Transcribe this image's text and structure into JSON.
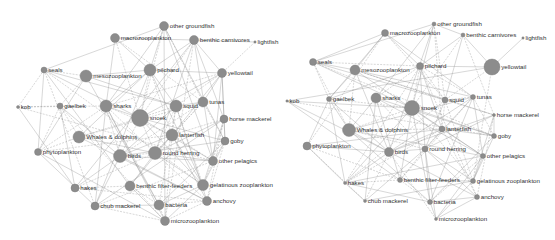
{
  "figure": {
    "panels": [
      {
        "id": "left",
        "node_color": "#8c8c8c",
        "edge_color": "#8a8a8a",
        "nodes": [
          {
            "label": "other groundfish",
            "x": 164,
            "y": 26,
            "r": 4.5
          },
          {
            "label": "macrozooplankton",
            "x": 115,
            "y": 38,
            "r": 4.5
          },
          {
            "label": "benthic carnivores",
            "x": 194,
            "y": 40,
            "r": 4.5
          },
          {
            "label": "lightfish",
            "x": 255,
            "y": 42,
            "r": 1.2
          },
          {
            "label": "seals",
            "x": 44,
            "y": 70,
            "r": 3
          },
          {
            "label": "mesozooplankton",
            "x": 86,
            "y": 76,
            "r": 6
          },
          {
            "label": "pilchard",
            "x": 150,
            "y": 70,
            "r": 6
          },
          {
            "label": "yellowtail",
            "x": 222,
            "y": 73,
            "r": 4.5
          },
          {
            "label": "kob",
            "x": 18,
            "y": 107,
            "r": 1.5
          },
          {
            "label": "gaelbek",
            "x": 60,
            "y": 106,
            "r": 3
          },
          {
            "label": "sharks",
            "x": 106,
            "y": 106,
            "r": 6
          },
          {
            "label": "snoek",
            "x": 140,
            "y": 118,
            "r": 8.5
          },
          {
            "label": "squid",
            "x": 176,
            "y": 106,
            "r": 6
          },
          {
            "label": "tunas",
            "x": 203,
            "y": 102,
            "r": 5
          },
          {
            "label": "horse mackerel",
            "x": 224,
            "y": 119,
            "r": 4
          },
          {
            "label": "Whales & dolphins",
            "x": 79,
            "y": 137,
            "r": 6
          },
          {
            "label": "lanterfish",
            "x": 172,
            "y": 135,
            "r": 6
          },
          {
            "label": "goby",
            "x": 225,
            "y": 141,
            "r": 4
          },
          {
            "label": "phytoplankton",
            "x": 38,
            "y": 152,
            "r": 3.5
          },
          {
            "label": "birds",
            "x": 120,
            "y": 156,
            "r": 6.5
          },
          {
            "label": "round herring",
            "x": 155,
            "y": 153,
            "r": 6.5
          },
          {
            "label": "other pelagics",
            "x": 213,
            "y": 161,
            "r": 4.5
          },
          {
            "label": "hakes",
            "x": 75,
            "y": 188,
            "r": 4
          },
          {
            "label": "benthic filter-feeders",
            "x": 130,
            "y": 186,
            "r": 5
          },
          {
            "label": "gelatinous zooplankton",
            "x": 203,
            "y": 185,
            "r": 5.5
          },
          {
            "label": "chub mackerel",
            "x": 95,
            "y": 206,
            "r": 4
          },
          {
            "label": "bacteria",
            "x": 159,
            "y": 205,
            "r": 5
          },
          {
            "label": "anchovy",
            "x": 207,
            "y": 201,
            "r": 4.5
          },
          {
            "label": "microzooplankton",
            "x": 165,
            "y": 221,
            "r": 4.5
          }
        ]
      },
      {
        "id": "right",
        "node_color": "#8c8c8c",
        "edge_color": "#8a8a8a",
        "nodes": [
          {
            "label": "other groundfish",
            "x": 434,
            "y": 24,
            "r": 2
          },
          {
            "label": "macrozooplankton",
            "x": 385,
            "y": 33,
            "r": 3.5
          },
          {
            "label": "benthic carnivores",
            "x": 463,
            "y": 35,
            "r": 2
          },
          {
            "label": "lightfish",
            "x": 523,
            "y": 38,
            "r": 1.2
          },
          {
            "label": "seals",
            "x": 313,
            "y": 62,
            "r": 3.5
          },
          {
            "label": "mesozooplankton",
            "x": 355,
            "y": 70,
            "r": 5
          },
          {
            "label": "pilchard",
            "x": 420,
            "y": 66,
            "r": 3.5
          },
          {
            "label": "yellowtail",
            "x": 492,
            "y": 67,
            "r": 8
          },
          {
            "label": "kob",
            "x": 287,
            "y": 101,
            "r": 1.2
          },
          {
            "label": "gaelbek",
            "x": 329,
            "y": 99,
            "r": 2.5
          },
          {
            "label": "sharks",
            "x": 376,
            "y": 98,
            "r": 5
          },
          {
            "label": "snoek",
            "x": 412,
            "y": 108,
            "r": 7.5
          },
          {
            "label": "squid",
            "x": 445,
            "y": 100,
            "r": 3
          },
          {
            "label": "tunas",
            "x": 473,
            "y": 97,
            "r": 2.5
          },
          {
            "label": "horse mackerel",
            "x": 494,
            "y": 115,
            "r": 1.5
          },
          {
            "label": "Whales & dolphins",
            "x": 349,
            "y": 130,
            "r": 6.5
          },
          {
            "label": "lanterfish",
            "x": 442,
            "y": 129,
            "r": 3
          },
          {
            "label": "goby",
            "x": 494,
            "y": 136,
            "r": 2.5
          },
          {
            "label": "phytoplankton",
            "x": 307,
            "y": 146,
            "r": 4
          },
          {
            "label": "birds",
            "x": 389,
            "y": 152,
            "r": 4.5
          },
          {
            "label": "round herring",
            "x": 425,
            "y": 149,
            "r": 3
          },
          {
            "label": "other pelagics",
            "x": 483,
            "y": 156,
            "r": 2.5
          },
          {
            "label": "hakes",
            "x": 345,
            "y": 183,
            "r": 1.5
          },
          {
            "label": "benthic filter-feeders",
            "x": 400,
            "y": 180,
            "r": 2.5
          },
          {
            "label": "gelatinous zooplankton",
            "x": 473,
            "y": 181,
            "r": 2.5
          },
          {
            "label": "chub mackerel",
            "x": 365,
            "y": 201,
            "r": 1.5
          },
          {
            "label": "bacteria",
            "x": 430,
            "y": 202,
            "r": 2.5
          },
          {
            "label": "anchovy",
            "x": 477,
            "y": 197,
            "r": 2.5
          },
          {
            "label": "microzooplankton",
            "x": 436,
            "y": 219,
            "r": 1.5
          }
        ]
      }
    ]
  }
}
